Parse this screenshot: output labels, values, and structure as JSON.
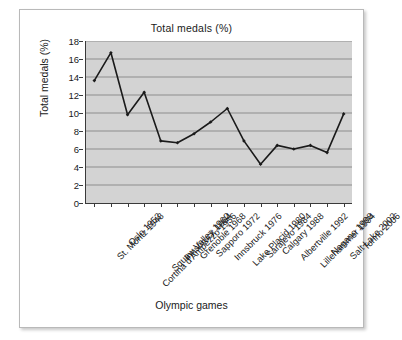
{
  "chart_data": {
    "type": "line",
    "title": "Total medals (%)",
    "xlabel": "Olympic games",
    "ylabel": "Total medals (%)",
    "grid": true,
    "legend": "none",
    "ylim": [
      0,
      18
    ],
    "yticks": [
      0,
      2,
      4,
      6,
      8,
      10,
      12,
      14,
      16,
      18
    ],
    "categories": [
      "St. Moritz 1948",
      "Oslo 1952",
      "Cortina d'Ampezzo 1956",
      "Squaw Valley 1960",
      "Innsbruck 1964",
      "Grenoble 1968",
      "Sapporo 1972",
      "Innsbruck 1976",
      "Lake Placid 1980",
      "Sarajevo 1984",
      "Calgary 1988",
      "Albertville 1992",
      "Lillehammer 1994",
      "Nagano 1998",
      "Salt Lake 2002",
      "Torino 2006"
    ],
    "values": [
      13.6,
      16.7,
      9.8,
      12.3,
      6.9,
      6.7,
      7.7,
      9.0,
      10.5,
      6.9,
      4.3,
      6.4,
      6.0,
      6.4,
      5.6,
      9.9
    ],
    "marker": "diamond",
    "line_color": "#1a1a1a",
    "plot_background": "#d3d3d3"
  }
}
